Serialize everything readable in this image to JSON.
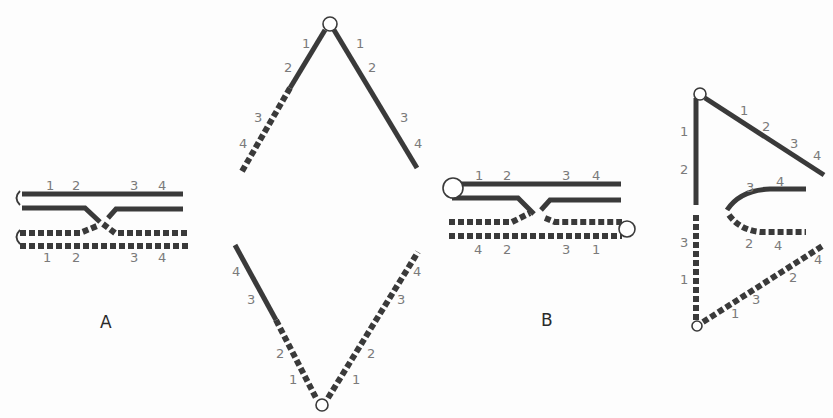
{
  "figure": {
    "colors": {
      "background": "#fdfdfd",
      "strand": "#3a3a3a",
      "locus_label": "#7a7a7a",
      "panel_label": "#2a2a2a"
    }
  },
  "panels": {
    "A": {
      "label": "A",
      "upper_strand_labels": [
        "1",
        "2",
        "3",
        "4"
      ],
      "lower_strand_labels": [
        "1",
        "2",
        "3",
        "4"
      ]
    },
    "A_anaphase": {
      "top_left_labels": [
        "1",
        "2",
        "3",
        "4"
      ],
      "top_right_labels": [
        "1",
        "2",
        "3",
        "4"
      ],
      "bottom_left_labels": [
        "4",
        "3",
        "2",
        "1"
      ],
      "bottom_right_labels": [
        "4",
        "3",
        "2",
        "1"
      ]
    },
    "B": {
      "label": "B",
      "upper_strand_labels": [
        "1",
        "2",
        "3",
        "4"
      ],
      "lower_strand_labels": [
        "4",
        "2",
        "3",
        "1"
      ]
    },
    "B_anaphase": {
      "vertical_labels": [
        "1",
        "2",
        "3",
        "1"
      ],
      "diagonal_top_labels": [
        "1",
        "2",
        "3",
        "4"
      ],
      "loop_upper_labels": [
        "3",
        "4"
      ],
      "loop_lower_labels": [
        "2",
        "4"
      ],
      "diagonal_bottom_labels": [
        "1",
        "3",
        "2",
        "4"
      ]
    }
  }
}
